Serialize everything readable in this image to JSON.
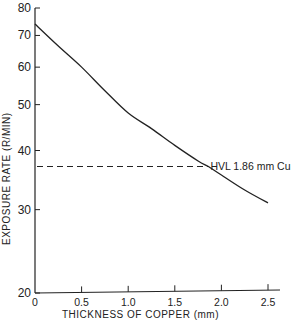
{
  "chart_data": {
    "type": "line",
    "title": "",
    "xlabel": "THICKNESS OF COPPER (mm)",
    "ylabel": "EXPOSURE RATE (R/MIN)",
    "xlim": [
      0,
      2.5
    ],
    "ylim": [
      20,
      80
    ],
    "y_scale": "log",
    "grid": false,
    "legend": null,
    "x_ticks": [
      "0",
      "0.5",
      "1.0",
      "1.5",
      "2.0",
      "2.5"
    ],
    "y_ticks": [
      "20",
      "30",
      "40",
      "50",
      "60",
      "70",
      "80"
    ],
    "series": [
      {
        "name": "Exposure rate vs copper thickness",
        "x": [
          0,
          0.25,
          0.5,
          0.75,
          1.0,
          1.25,
          1.5,
          1.75,
          1.86,
          2.0,
          2.25,
          2.5
        ],
        "values": [
          74,
          66.5,
          60,
          53.5,
          48,
          44.5,
          41,
          38,
          37,
          35.5,
          33,
          31
        ]
      }
    ],
    "annotations": [
      {
        "text": "HVL 1.86 mm Cu",
        "x": 1.86,
        "y": 37,
        "type": "dashed-horizontal-reference"
      }
    ]
  },
  "labels": {
    "x_axis_title": "THICKNESS OF COPPER (mm)",
    "y_axis_title": "EXPOSURE RATE (R/MIN)",
    "hvl_annotation": "HVL 1.86 mm Cu"
  }
}
